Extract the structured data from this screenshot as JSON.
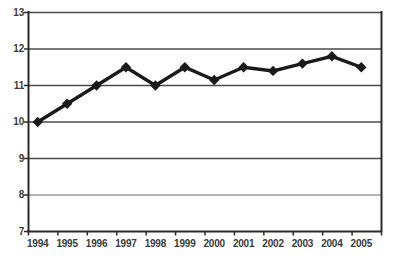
{
  "chart_data": {
    "type": "line",
    "title": "",
    "subtitle": "",
    "xlabel": "",
    "ylabel": "",
    "categories": [
      "1994",
      "1995",
      "1996",
      "1997",
      "1998",
      "1999",
      "2000",
      "2001",
      "2002",
      "2003",
      "2004",
      "2005"
    ],
    "values": [
      10.0,
      10.5,
      11.0,
      11.5,
      11.0,
      11.5,
      11.15,
      11.5,
      11.4,
      11.6,
      11.8,
      11.5
    ],
    "series": [
      {
        "name": "series-1",
        "values": [
          10.0,
          10.5,
          11.0,
          11.5,
          11.0,
          11.5,
          11.15,
          11.5,
          11.4,
          11.6,
          11.8,
          11.5
        ]
      }
    ],
    "x_tick_labels": [
      "1994",
      "1995",
      "1996",
      "1997",
      "1998",
      "1999",
      "2000",
      "2001",
      "2002",
      "2003",
      "2004",
      "2005"
    ],
    "y_tick_labels": [
      "13",
      "12",
      "11",
      "10",
      "9",
      "8",
      "7"
    ],
    "y_ticks": [
      13,
      12,
      11,
      10,
      9,
      8,
      7
    ],
    "ylim": [
      7,
      13
    ],
    "xlim": [
      "1994",
      "2005"
    ],
    "grid": "horizontal",
    "legend": "none",
    "marker": "diamond",
    "line_color": "#1a1a1a",
    "marker_color": "#1a1a1a",
    "grid_color": "#555555",
    "axis_color": "#2b2b2b",
    "background_color": "#ffffff",
    "annotations": []
  },
  "axis": {
    "y_labels": [
      {
        "text": "13",
        "value": 13
      },
      {
        "text": "12",
        "value": 12
      },
      {
        "text": "11",
        "value": 11
      },
      {
        "text": "10",
        "value": 10
      },
      {
        "text": "9",
        "value": 9
      },
      {
        "text": "8",
        "value": 8
      },
      {
        "text": "7",
        "value": 7
      }
    ],
    "x_labels": [
      {
        "text": "1994"
      },
      {
        "text": "1995"
      },
      {
        "text": "1996"
      },
      {
        "text": "1997"
      },
      {
        "text": "1998"
      },
      {
        "text": "1999"
      },
      {
        "text": "2000"
      },
      {
        "text": "2001"
      },
      {
        "text": "2002"
      },
      {
        "text": "2003"
      },
      {
        "text": "2004"
      },
      {
        "text": "2005"
      }
    ]
  }
}
